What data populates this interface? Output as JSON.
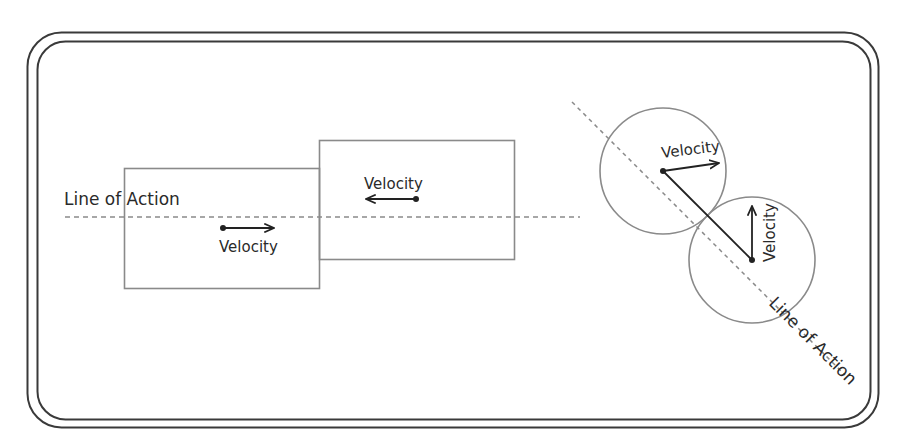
{
  "diagram": {
    "colors": {
      "frame": "#3a3a3a",
      "shape": "#8a8a8a",
      "dash": "#8a8a8a",
      "vector": "#222222",
      "text": "#2a2a2a",
      "background": "#ffffff"
    },
    "left_panel": {
      "line_of_action_label": "Line of Action",
      "block_a": {
        "velocity_label": "Velocity",
        "direction": "right"
      },
      "block_b": {
        "velocity_label": "Velocity",
        "direction": "left"
      }
    },
    "right_panel": {
      "line_of_action_label": "Line of Action",
      "ball_a": {
        "velocity_label": "Velocity",
        "direction": "right-slightly-up"
      },
      "ball_b": {
        "velocity_label": "Velocity",
        "direction": "up"
      }
    }
  }
}
